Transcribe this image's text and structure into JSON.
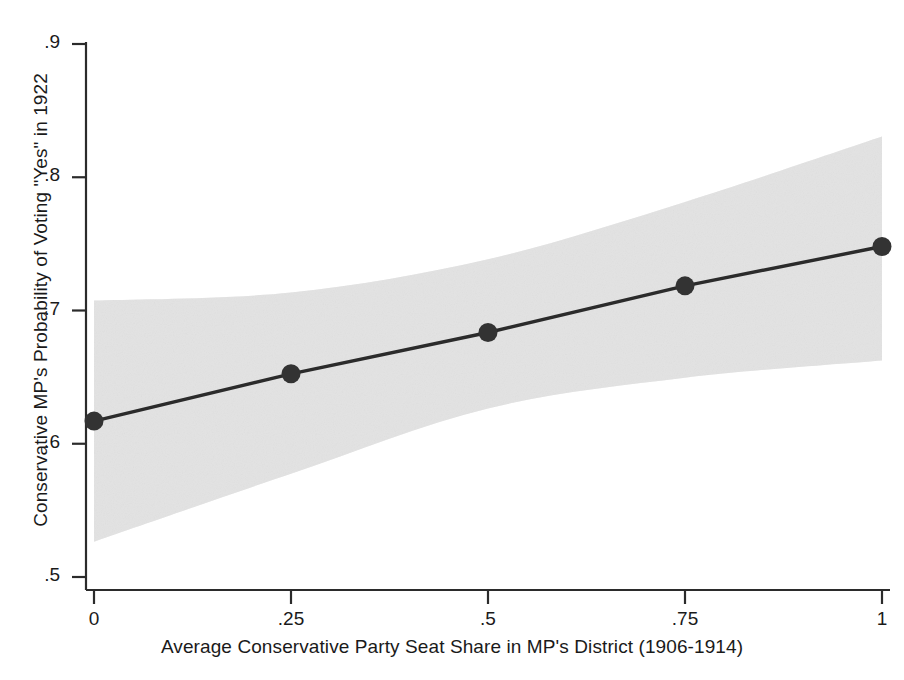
{
  "chart_data": {
    "type": "line",
    "title": "",
    "xlabel": "Average Conservative Party Seat Share in MP's District (1906-1914)",
    "ylabel": "Conservative MP's Probability of Voting \"Yes\" in 1922",
    "xlim": [
      0,
      1
    ],
    "ylim": [
      0.5,
      0.9
    ],
    "grid": false,
    "legend": "none",
    "x_ticks": [
      "0",
      ".25",
      ".5",
      ".75",
      "1"
    ],
    "x_tick_values": [
      0,
      0.25,
      0.5,
      0.75,
      1
    ],
    "y_ticks": [
      ".5",
      ".6",
      ".7",
      ".8",
      ".9"
    ],
    "y_tick_values": [
      0.5,
      0.6,
      0.7,
      0.8,
      0.9
    ],
    "series": [
      {
        "name": "Predicted probability",
        "type": "line-with-markers",
        "color": "#2b2b2b",
        "x": [
          0,
          0.25,
          0.5,
          0.75,
          1
        ],
        "values": [
          0.617,
          0.6525,
          0.6835,
          0.7185,
          0.748
        ]
      },
      {
        "name": "95% confidence interval",
        "type": "band",
        "color": "#e6e6e6",
        "x": [
          0,
          0.25,
          0.5,
          0.75,
          1
        ],
        "upper": [
          0.7075,
          0.7135,
          0.7385,
          0.7815,
          0.8305
        ],
        "lower": [
          0.5265,
          0.5775,
          0.6265,
          0.6495,
          0.6625
        ]
      }
    ]
  },
  "axes": {
    "y_label_text": "Conservative MP's Probability of Voting \"Yes\" in 1922",
    "x_label_text": "Average Conservative Party Seat Share in MP's District (1906-1914)"
  },
  "ticks": {
    "y": [
      {
        "label": ".9",
        "value": 0.9
      },
      {
        "label": ".8",
        "value": 0.8
      },
      {
        "label": ".7",
        "value": 0.7
      },
      {
        "label": ".6",
        "value": 0.6
      },
      {
        "label": ".5",
        "value": 0.5
      }
    ],
    "x": [
      {
        "label": "0",
        "value": 0
      },
      {
        "label": ".25",
        "value": 0.25
      },
      {
        "label": ".5",
        "value": 0.5
      },
      {
        "label": ".75",
        "value": 0.75
      },
      {
        "label": "1",
        "value": 1
      }
    ]
  },
  "style": {
    "axis_color": "#2b2b2b",
    "line_color": "#2b2b2b",
    "marker_color": "#333333",
    "band_color": "#e7e7e7",
    "background": "#ffffff"
  }
}
